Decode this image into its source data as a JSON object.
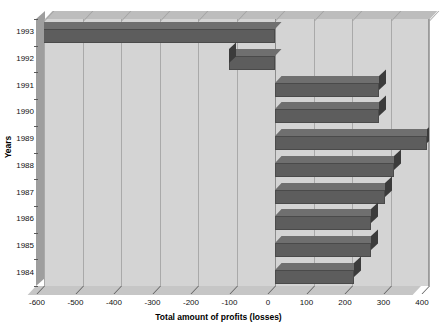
{
  "chart_data": {
    "type": "bar",
    "orientation": "horizontal",
    "title": "",
    "xlabel": "Total amount of profits (losses)",
    "ylabel": "Years",
    "categories": [
      "1993",
      "1992",
      "1991",
      "1990",
      "1989",
      "1988",
      "1987",
      "1986",
      "1985",
      "1984"
    ],
    "values": [
      -620,
      -120,
      270,
      270,
      395,
      310,
      285,
      250,
      250,
      205
    ],
    "xlim": [
      -600,
      400
    ],
    "xticks": [
      -600,
      -500,
      -400,
      -300,
      -200,
      -100,
      0,
      100,
      200,
      300,
      400
    ],
    "xtick_labels": [
      "-600",
      "-500",
      "-400",
      "-300",
      "-200",
      "-100",
      "0",
      "100",
      "200",
      "300",
      "400"
    ],
    "grid": true,
    "legend": "none",
    "style": "3d-bar",
    "bar_color": "#5d5d5d",
    "plot_background": "#d4d4d4",
    "figure_background": "#ffffff"
  },
  "axes": {
    "y_label": "Years",
    "x_label": "Total amount of profits (losses)"
  }
}
